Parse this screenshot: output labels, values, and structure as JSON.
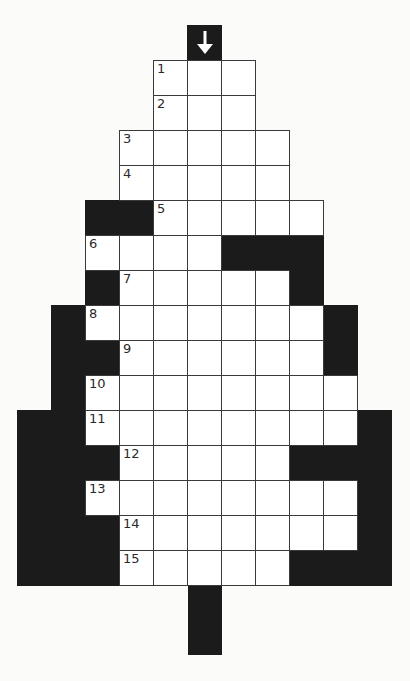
{
  "puzzle": {
    "type": "crossword-tree",
    "colors": {
      "block": "#1b1b1b",
      "cell": "#ffffff",
      "line": "#3a3a3a",
      "background": "#fbfbfa"
    },
    "grid": {
      "origin_x": 17,
      "origin_y": 60,
      "cell_w": 34,
      "cell_h": 35,
      "columns": 11
    },
    "arrow": {
      "icon": "arrow-down-icon",
      "col": 5,
      "y": 25
    },
    "trunk": {
      "col": 5,
      "y": 585,
      "height": 70
    },
    "rows": [
      {
        "number": "1",
        "number_col": 4,
        "white": [
          4,
          5,
          6
        ],
        "black": []
      },
      {
        "number": "2",
        "number_col": 4,
        "white": [
          4,
          5,
          6
        ],
        "black": []
      },
      {
        "number": "3",
        "number_col": 3,
        "white": [
          3,
          4,
          5,
          6,
          7
        ],
        "black": []
      },
      {
        "number": "4",
        "number_col": 3,
        "white": [
          3,
          4,
          5,
          6,
          7
        ],
        "black": []
      },
      {
        "number": "5",
        "number_col": 4,
        "white": [
          4,
          5,
          6,
          7,
          8
        ],
        "black": [
          2,
          3
        ]
      },
      {
        "number": "6",
        "number_col": 2,
        "white": [
          2,
          3,
          4,
          5
        ],
        "black": [
          6,
          7,
          8
        ]
      },
      {
        "number": "7",
        "number_col": 3,
        "white": [
          3,
          4,
          5,
          6,
          7
        ],
        "black": [
          2,
          8
        ]
      },
      {
        "number": "8",
        "number_col": 2,
        "white": [
          2,
          3,
          4,
          5,
          6,
          7,
          8
        ],
        "black": [
          1,
          9
        ]
      },
      {
        "number": "9",
        "number_col": 3,
        "white": [
          3,
          4,
          5,
          6,
          7,
          8
        ],
        "black": [
          1,
          2,
          9
        ]
      },
      {
        "number": "10",
        "number_col": 2,
        "white": [
          2,
          3,
          4,
          5,
          6,
          7,
          8,
          9
        ],
        "black": [
          1
        ]
      },
      {
        "number": "11",
        "number_col": 2,
        "white": [
          2,
          3,
          4,
          5,
          6,
          7,
          8,
          9
        ],
        "black": [
          0,
          1,
          10
        ]
      },
      {
        "number": "12",
        "number_col": 3,
        "white": [
          3,
          4,
          5,
          6,
          7
        ],
        "black": [
          0,
          1,
          2,
          8,
          9,
          10
        ]
      },
      {
        "number": "13",
        "number_col": 2,
        "white": [
          2,
          3,
          4,
          5,
          6,
          7,
          8,
          9
        ],
        "black": [
          0,
          1,
          10
        ]
      },
      {
        "number": "14",
        "number_col": 3,
        "white": [
          3,
          4,
          5,
          6,
          7,
          8,
          9
        ],
        "black": [
          0,
          1,
          2,
          10
        ]
      },
      {
        "number": "15",
        "number_col": 3,
        "white": [
          3,
          4,
          5,
          6,
          7
        ],
        "black": [
          0,
          1,
          2,
          8,
          9,
          10
        ]
      }
    ]
  }
}
